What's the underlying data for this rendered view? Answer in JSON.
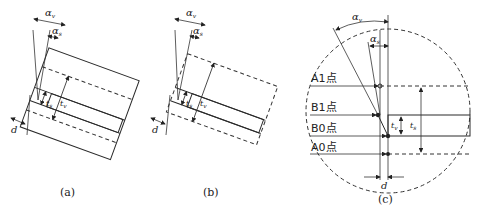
{
  "figure": {
    "panels": [
      {
        "id": "a",
        "caption": "(a)",
        "labels": {
          "alpha_v": "α",
          "alpha_v_sub": "v",
          "alpha_s": "α",
          "alpha_s_sub": "s",
          "d": "d",
          "t_s": "t",
          "t_s_sub": "s",
          "t_v": "t",
          "t_v_sub": "v"
        }
      },
      {
        "id": "b",
        "caption": "(b)",
        "labels": {
          "alpha_v": "α",
          "alpha_v_sub": "v",
          "alpha_s": "α",
          "alpha_s_sub": "s",
          "d": "d",
          "t_s": "t",
          "t_s_sub": "s",
          "t_v": "t",
          "t_v_sub": "v"
        }
      },
      {
        "id": "c",
        "caption": "(c)",
        "labels": {
          "alpha_v": "α",
          "alpha_v_sub": "v",
          "alpha_s": "α",
          "alpha_s_sub": "s",
          "d": "d",
          "t_s": "t",
          "t_s_sub": "s",
          "t_v": "t",
          "t_v_sub": "v"
        },
        "points": [
          "A1点",
          "B1点",
          "B0点",
          "A0点"
        ]
      }
    ],
    "colors": {
      "line": "#2a2a2a",
      "background": "#ffffff"
    }
  }
}
